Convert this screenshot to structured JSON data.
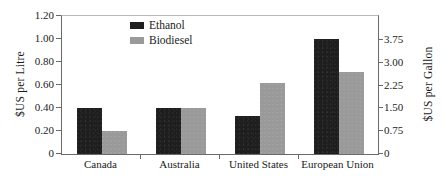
{
  "chart_data": {
    "type": "bar",
    "title": "",
    "categories": [
      "Canada",
      "Australia",
      "United States",
      "European Union"
    ],
    "series": [
      {
        "name": "Ethanol",
        "color": "#1e1e1e",
        "values": [
          0.4,
          0.4,
          0.33,
          1.0
        ]
      },
      {
        "name": "Biodiesel",
        "color": "#9a9a9a",
        "values": [
          0.2,
          0.4,
          0.62,
          0.71
        ]
      }
    ],
    "xlabel": "",
    "ylabel": "$US per Litre",
    "ylabel_secondary": "$US per Gallon",
    "ylim": [
      0,
      1.2
    ],
    "ylim_secondary": [
      0,
      4.542
    ],
    "yticks": [
      "0",
      "0.20",
      "0.40",
      "0.60",
      "0.80",
      "1.00",
      "1.20"
    ],
    "ytick_values": [
      0,
      0.2,
      0.4,
      0.6,
      0.8,
      1.0,
      1.2
    ],
    "yticks_secondary": [
      "0",
      "0.75",
      "1.50",
      "2.25",
      "3.00",
      "3.75"
    ],
    "ytick_values_secondary": [
      0,
      0.75,
      1.5,
      2.25,
      3.0,
      3.75
    ],
    "grid": false,
    "legend_position": "top-left-inside",
    "legend": [
      "Ethanol",
      "Biodiesel"
    ]
  },
  "axes": {
    "left_title": "$US per Litre",
    "right_title": "$US per Gallon",
    "left_ticks": [
      "1.20",
      "1.00",
      "0.80",
      "0.60",
      "0.40",
      "0.20",
      "0"
    ],
    "right_ticks": [
      "3.75",
      "3.00",
      "2.25",
      "1.50",
      "0.75",
      "0"
    ]
  },
  "legend": {
    "items": [
      {
        "label": "Ethanol",
        "color": "#1e1e1e"
      },
      {
        "label": "Biodiesel",
        "color": "#9a9a9a"
      }
    ]
  },
  "categories": [
    "Canada",
    "Australia",
    "United States",
    "European Union"
  ]
}
